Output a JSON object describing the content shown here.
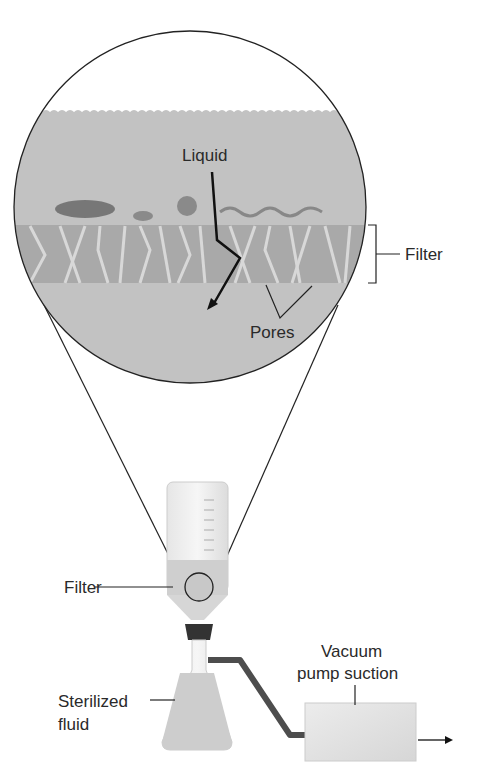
{
  "diagram": {
    "magnified_view": {
      "liquid_label": "Liquid",
      "filter_label": "Filter",
      "pores_label": "Pores"
    },
    "apparatus": {
      "filter_label": "Filter",
      "sterilized_fluid_label_line1": "Sterilized",
      "sterilized_fluid_label_line2": "fluid",
      "vacuum_label_line1": "Vacuum",
      "vacuum_label_line2": "pump suction"
    },
    "colors": {
      "liquid_fill": "#b9b9b9",
      "filter_band": "#a8a8a8",
      "outline": "#222222",
      "tube": "#555555"
    }
  }
}
